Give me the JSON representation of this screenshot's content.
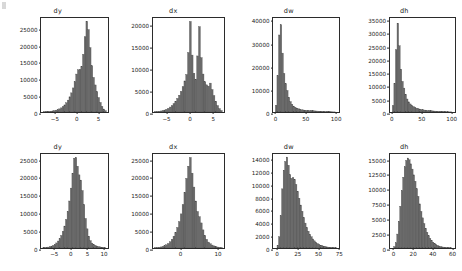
{
  "figure": {
    "background": "#ffffff",
    "bar_fill": "#6b6b6b",
    "bar_edge": "#4a4a4a",
    "axis_color": "#2b2b2b",
    "text_color": "#1a1a1a",
    "rows": 2,
    "cols": 4
  },
  "chart_data": [
    {
      "type": "bar",
      "panel": "top-dy",
      "title": "dy",
      "xlabel": "",
      "ylabel": "",
      "grid": false,
      "legend": null,
      "xlim": [
        -8.2,
        7.6
      ],
      "ylim": [
        0,
        28500
      ],
      "xticks": [
        -5,
        0,
        5
      ],
      "xticklabels": [
        "−5",
        "0",
        "5"
      ],
      "yticks": [
        0,
        5000,
        10000,
        15000,
        20000,
        25000
      ],
      "yticklabels": [
        "0",
        "5000",
        "10000",
        "15000",
        "20000",
        "25000"
      ],
      "bin_edges": [
        -7.6,
        -7.2,
        -6.8,
        -6.4,
        -6.0,
        -5.6,
        -5.2,
        -4.8,
        -4.4,
        -4.0,
        -3.6,
        -3.2,
        -2.8,
        -2.4,
        -2.0,
        -1.6,
        -1.2,
        -0.8,
        -0.4,
        0.0,
        0.4,
        0.8,
        1.2,
        1.6,
        2.0,
        2.4,
        2.8,
        3.2,
        3.6,
        4.0,
        4.4,
        4.8,
        5.2,
        5.6,
        6.0,
        6.4,
        6.8,
        7.2
      ],
      "values": [
        60,
        90,
        130,
        180,
        240,
        330,
        430,
        560,
        720,
        950,
        1250,
        1650,
        2150,
        2800,
        3600,
        4600,
        5800,
        7300,
        9200,
        11500,
        12800,
        12900,
        13800,
        17500,
        22800,
        27500,
        25000,
        19500,
        14000,
        10500,
        8200,
        6200,
        4400,
        2900,
        1700,
        900,
        400,
        150
      ]
    },
    {
      "type": "bar",
      "panel": "top-dx",
      "title": "dx",
      "xlabel": "",
      "ylabel": "",
      "grid": false,
      "legend": null,
      "xlim": [
        -8.0,
        7.6
      ],
      "ylim": [
        0,
        21800
      ],
      "xticks": [
        -5,
        0,
        5
      ],
      "xticklabels": [
        "−5",
        "0",
        "5"
      ],
      "yticks": [
        0,
        5000,
        10000,
        15000,
        20000
      ],
      "yticklabels": [
        "0",
        "5000",
        "10000",
        "15000",
        "20000"
      ],
      "bin_edges": [
        -7.6,
        -7.2,
        -6.8,
        -6.4,
        -6.0,
        -5.6,
        -5.2,
        -4.8,
        -4.4,
        -4.0,
        -3.6,
        -3.2,
        -2.8,
        -2.4,
        -2.0,
        -1.6,
        -1.2,
        -0.8,
        -0.4,
        0.0,
        0.4,
        0.8,
        1.2,
        1.6,
        2.0,
        2.4,
        2.8,
        3.2,
        3.6,
        4.0,
        4.4,
        4.8,
        5.2,
        5.6,
        6.0,
        6.4,
        6.8,
        7.2
      ],
      "values": [
        80,
        120,
        170,
        240,
        330,
        450,
        620,
        850,
        1150,
        1500,
        1950,
        2500,
        3150,
        3900,
        4800,
        5900,
        7200,
        8700,
        13800,
        21000,
        13200,
        9000,
        7600,
        13000,
        19800,
        12600,
        8800,
        7000,
        6300,
        6000,
        6700,
        5200,
        3800,
        2500,
        1500,
        800,
        350,
        120
      ]
    },
    {
      "type": "bar",
      "panel": "top-dw",
      "title": "dw",
      "xlabel": "",
      "ylabel": "",
      "grid": false,
      "legend": null,
      "xlim": [
        -4,
        108
      ],
      "ylim": [
        0,
        41500
      ],
      "xticks": [
        0,
        50,
        100
      ],
      "xticklabels": [
        "0",
        "50",
        "100"
      ],
      "yticks": [
        0,
        10000,
        20000,
        30000,
        40000
      ],
      "yticklabels": [
        "0",
        "10000",
        "20000",
        "30000",
        "40000"
      ],
      "bin_edges": [
        0,
        2.7,
        5.4,
        8.1,
        10.8,
        13.5,
        16.2,
        18.9,
        21.6,
        24.3,
        27,
        29.7,
        32.4,
        35.1,
        37.8,
        40.5,
        43.2,
        45.9,
        48.6,
        51.3,
        54,
        56.7,
        59.4,
        62.1,
        64.8,
        67.5,
        70.2,
        72.9,
        75.6,
        78.3,
        81,
        83.7,
        86.4,
        89.1,
        91.8,
        94.5,
        97.2,
        99.9,
        102.6
      ],
      "values": [
        3000,
        16000,
        34000,
        38500,
        26000,
        17000,
        12500,
        9500,
        6500,
        4600,
        3400,
        2600,
        2100,
        1700,
        1400,
        1200,
        1000,
        900,
        800,
        750,
        700,
        650,
        600,
        550,
        500,
        450,
        400,
        350,
        300,
        250,
        200,
        170,
        140,
        110,
        90,
        70,
        50,
        35,
        20
      ]
    },
    {
      "type": "bar",
      "panel": "top-dh",
      "title": "dh",
      "xlabel": "",
      "ylabel": "",
      "grid": false,
      "legend": null,
      "xlim": [
        -4,
        108
      ],
      "ylim": [
        0,
        36200
      ],
      "xticks": [
        0,
        50,
        100
      ],
      "xticklabels": [
        "0",
        "50",
        "100"
      ],
      "yticks": [
        0,
        5000,
        10000,
        15000,
        20000,
        25000,
        30000,
        35000
      ],
      "yticklabels": [
        "0",
        "5000",
        "10000",
        "15000",
        "20000",
        "25000",
        "30000",
        "35000"
      ],
      "bin_edges": [
        0,
        2.7,
        5.4,
        8.1,
        10.8,
        13.5,
        16.2,
        18.9,
        21.6,
        24.3,
        27,
        29.7,
        32.4,
        35.1,
        37.8,
        40.5,
        43.2,
        45.9,
        48.6,
        51.3,
        54,
        56.7,
        59.4,
        62.1,
        64.8,
        67.5,
        70.2,
        72.9,
        75.6,
        78.3,
        81,
        83.7,
        86.4,
        89.1,
        91.8,
        94.5,
        97.2,
        99.9,
        102.6
      ],
      "values": [
        2500,
        11000,
        24000,
        34200,
        25500,
        16500,
        11800,
        9200,
        6800,
        5000,
        3900,
        3100,
        2500,
        2100,
        1800,
        1500,
        1300,
        1100,
        950,
        850,
        750,
        680,
        600,
        540,
        480,
        430,
        380,
        330,
        280,
        240,
        200,
        170,
        140,
        110,
        90,
        70,
        50,
        35,
        20
      ]
    },
    {
      "type": "bar",
      "panel": "bottom-dy",
      "title": "dy",
      "xlabel": "",
      "ylabel": "",
      "grid": false,
      "legend": null,
      "xlim": [
        -9.0,
        11.8
      ],
      "ylim": [
        0,
        27000
      ],
      "xticks": [
        -5,
        0,
        5,
        10
      ],
      "xticklabels": [
        "−5",
        "0",
        "5",
        "10"
      ],
      "yticks": [
        0,
        5000,
        10000,
        15000,
        20000,
        25000
      ],
      "yticklabels": [
        "0",
        "5000",
        "10000",
        "15000",
        "20000",
        "25000"
      ],
      "bin_edges": [
        -8.4,
        -7.9,
        -7.4,
        -6.9,
        -6.4,
        -5.9,
        -5.4,
        -4.9,
        -4.4,
        -3.9,
        -3.4,
        -2.9,
        -2.4,
        -1.9,
        -1.4,
        -0.9,
        -0.4,
        0.1,
        0.6,
        1.1,
        1.6,
        2.1,
        2.6,
        3.1,
        3.6,
        4.1,
        4.6,
        5.1,
        5.6,
        6.1,
        6.6,
        7.1,
        7.6,
        8.1,
        8.6,
        9.1,
        9.6,
        10.1,
        10.6,
        11.1
      ],
      "values": [
        80,
        120,
        180,
        260,
        380,
        540,
        760,
        1050,
        1450,
        2000,
        2700,
        3600,
        4800,
        6300,
        8200,
        10500,
        13500,
        17200,
        21500,
        25800,
        26000,
        23500,
        21000,
        19500,
        16500,
        12500,
        8500,
        5500,
        3400,
        2100,
        1400,
        1000,
        750,
        560,
        420,
        310,
        230,
        160,
        110,
        70
      ]
    },
    {
      "type": "bar",
      "panel": "bottom-dx",
      "title": "dx",
      "xlabel": "",
      "ylabel": "",
      "grid": false,
      "legend": null,
      "xlim": [
        -7.5,
        12.0
      ],
      "ylim": [
        0,
        27000
      ],
      "xticks": [
        0,
        10
      ],
      "xticklabels": [
        "0",
        "10"
      ],
      "yticks": [
        0,
        5000,
        10000,
        15000,
        20000,
        25000
      ],
      "yticklabels": [
        "0",
        "5000",
        "10000",
        "15000",
        "20000",
        "25000"
      ],
      "bin_edges": [
        -7.0,
        -6.5,
        -6.0,
        -5.5,
        -5.0,
        -4.5,
        -4.0,
        -3.5,
        -3.0,
        -2.5,
        -2.0,
        -1.5,
        -1.0,
        -0.5,
        0.0,
        0.5,
        1.0,
        1.5,
        2.0,
        2.5,
        3.0,
        3.5,
        4.0,
        4.5,
        5.0,
        5.5,
        6.0,
        6.5,
        7.0,
        7.5,
        8.0,
        8.5,
        9.0,
        9.5,
        10.0,
        10.5,
        11.0,
        11.5
      ],
      "values": [
        90,
        140,
        210,
        310,
        450,
        650,
        920,
        1300,
        1800,
        2500,
        3400,
        4500,
        5900,
        7600,
        9800,
        12500,
        16000,
        20000,
        23500,
        26000,
        21500,
        17500,
        13500,
        10500,
        9000,
        7200,
        5200,
        3600,
        2500,
        1700,
        1200,
        850,
        600,
        420,
        290,
        200,
        130,
        80
      ]
    },
    {
      "type": "bar",
      "panel": "bottom-dw",
      "title": "dw",
      "xlabel": "",
      "ylabel": "",
      "grid": false,
      "legend": null,
      "xlim": [
        -5,
        77
      ],
      "ylim": [
        0,
        15100
      ],
      "xticks": [
        0,
        25,
        50,
        75
      ],
      "xticklabels": [
        "0",
        "25",
        "50",
        "75"
      ],
      "yticks": [
        0,
        2000,
        4000,
        6000,
        8000,
        10000,
        12000,
        14000
      ],
      "yticklabels": [
        "0",
        "2000",
        "4000",
        "6000",
        "8000",
        "10000",
        "12000",
        "14000"
      ],
      "bin_edges": [
        0,
        1.9,
        3.8,
        5.7,
        7.6,
        9.5,
        11.4,
        13.3,
        15.2,
        17.1,
        19,
        20.9,
        22.8,
        24.7,
        26.6,
        28.5,
        30.4,
        32.3,
        34.2,
        36.1,
        38,
        39.9,
        41.8,
        43.7,
        45.6,
        47.5,
        49.4,
        51.3,
        53.2,
        55.1,
        57,
        58.9,
        60.8,
        62.7,
        64.6,
        66.5,
        68.4,
        70.3,
        72.2,
        74.1
      ],
      "values": [
        450,
        1800,
        5200,
        9500,
        12500,
        13900,
        14600,
        13300,
        11800,
        11200,
        11300,
        11000,
        10200,
        9100,
        8000,
        6900,
        5900,
        4900,
        4000,
        3300,
        2700,
        2200,
        1800,
        1450,
        1150,
        900,
        720,
        570,
        450,
        360,
        290,
        230,
        180,
        140,
        110,
        85,
        65,
        50,
        35,
        20
      ]
    },
    {
      "type": "bar",
      "panel": "bottom-dh",
      "title": "dh",
      "xlabel": "",
      "ylabel": "",
      "grid": false,
      "legend": null,
      "xlim": [
        -4,
        64
      ],
      "ylim": [
        0,
        16200
      ],
      "xticks": [
        0,
        20,
        40,
        60
      ],
      "xticklabels": [
        "0",
        "20",
        "40",
        "60"
      ],
      "yticks": [
        0,
        2500,
        5000,
        7500,
        10000,
        12500,
        15000
      ],
      "yticklabels": [
        "0",
        "2500",
        "5000",
        "7500",
        "10000",
        "12500",
        "15000"
      ],
      "bin_edges": [
        0,
        1.55,
        3.1,
        4.65,
        6.2,
        7.75,
        9.3,
        10.85,
        12.4,
        13.95,
        15.5,
        17.05,
        18.6,
        20.15,
        21.7,
        23.25,
        24.8,
        26.35,
        27.9,
        29.45,
        31,
        32.55,
        34.1,
        35.65,
        37.2,
        38.75,
        40.3,
        41.85,
        43.4,
        44.95,
        46.5,
        48.05,
        49.6,
        51.15,
        52.7,
        54.25,
        55.8,
        57.35,
        58.9,
        60.45
      ],
      "values": [
        250,
        900,
        2400,
        4600,
        7200,
        9900,
        12200,
        14000,
        15100,
        15500,
        15200,
        14500,
        13600,
        12600,
        11500,
        10200,
        8900,
        7600,
        6300,
        5200,
        4200,
        3400,
        2700,
        2100,
        1650,
        1300,
        1000,
        780,
        600,
        460,
        350,
        270,
        200,
        155,
        115,
        85,
        65,
        45,
        30,
        18
      ]
    }
  ]
}
